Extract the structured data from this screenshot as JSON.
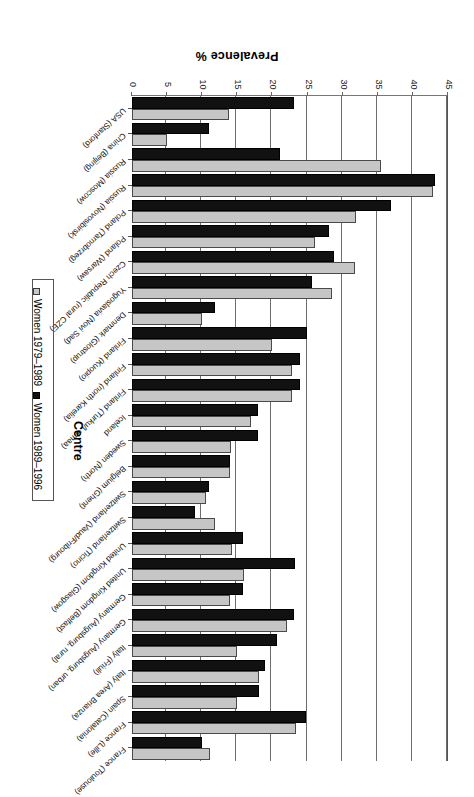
{
  "chart_data": {
    "type": "bar",
    "orientation": "horizontal",
    "title": "",
    "xlabel": "Prevalence %",
    "ylabel": "Centre",
    "xlim": [
      0,
      45
    ],
    "xticks": [
      0,
      5,
      10,
      15,
      20,
      25,
      30,
      35,
      40,
      45
    ],
    "grid": true,
    "legend_position": "right",
    "categories": [
      "France (Toulouse)",
      "France (Lille)",
      "Spain (Catalonia)",
      "Italy (Area Brianza)",
      "Italy (Friuli)",
      "Germany (Augsburg, urban)",
      "Germany (Augsburg, rural)",
      "United Kingdom (Belfast)",
      "United Kingdom (Glasgow)",
      "Switzerland (Ticino)",
      "Switzerland (Vaud/Fribourg)",
      "Belgium (Ghent)",
      "Sweden (North)",
      "Iceland",
      "Finland (Turku/Loimaa)",
      "Finland (north Karelia)",
      "Finland (Kuopio)",
      "Denmark (Glostrup)",
      "Yugoslavia (Novi Sad)",
      "Czech Republic (rural CZE)",
      "Poland (Warsaw)",
      "Poland (Tarnobrzeg)",
      "Russia (Novosibirsk)",
      "Russia (Moscow)",
      "China (Beijing)",
      "USA (Stanford)"
    ],
    "series": [
      {
        "name": "Women 1979–1989",
        "color": "#c6c6c6",
        "values": [
          11.1,
          23.4,
          15.0,
          18.1,
          15.0,
          22.1,
          14.0,
          16.0,
          14.2,
          11.8,
          10.5,
          13.9,
          14.1,
          16.9,
          22.8,
          22.8,
          19.9,
          9.9,
          28.5,
          31.7,
          26.0,
          31.9,
          42.9,
          35.4,
          5.0,
          13.8
        ]
      },
      {
        "name": "Women 1989–1996",
        "color": "#111111",
        "values": [
          9.9,
          24.8,
          18.1,
          18.9,
          20.6,
          23.1,
          15.8,
          23.2,
          15.8,
          9.0,
          11.0,
          13.9,
          17.9,
          17.9,
          23.9,
          23.9,
          24.9,
          11.8,
          25.6,
          28.8,
          28.0,
          36.9,
          43.1,
          21.1,
          11.0,
          23.1
        ]
      }
    ]
  },
  "legend": {
    "entries": [
      {
        "label": "Women 1979–1989",
        "swatch": "light"
      },
      {
        "label": "Women 1989–1996",
        "swatch": "dark"
      }
    ]
  },
  "axes": {
    "x_title": "Prevalence %",
    "y_title": "Centre"
  }
}
